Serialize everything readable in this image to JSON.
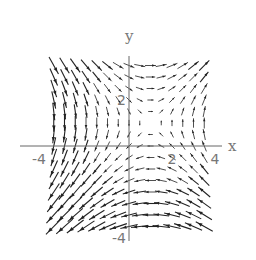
{
  "chart_data": {
    "type": "vector_field",
    "title": "",
    "xlabel": "x",
    "ylabel": "y",
    "xlim": [
      -4,
      4
    ],
    "ylim": [
      -4,
      4
    ],
    "grid": false,
    "legend": null,
    "x_ticks": [
      {
        "value": -4,
        "label": "-4"
      },
      {
        "value": -2,
        "label": "-2"
      },
      {
        "value": 2,
        "label": "2"
      },
      {
        "value": 4,
        "label": "4"
      }
    ],
    "y_ticks": [
      {
        "value": 2,
        "label": "2"
      },
      {
        "value": -4,
        "label": "-4"
      }
    ],
    "field": {
      "description": "Saddle-type flow: incoming along upper-left / lower-right diagonal, outgoing toward upper-right and lower-left",
      "u": "y - 1",
      "v": "x - 1",
      "equilibrium": [
        1,
        1
      ],
      "grid_range": [
        -3.5,
        3.5
      ],
      "grid_step": 0.5
    },
    "style": {
      "arrow_color": "#222222",
      "axis_color": "#666666",
      "label_color": "#777777"
    }
  }
}
